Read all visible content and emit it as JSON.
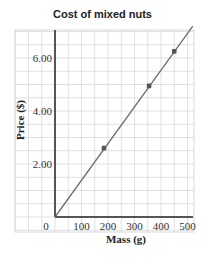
{
  "chart_data": {
    "type": "line",
    "title": "Cost of mixed nuts",
    "xlabel": "Mass (g)",
    "ylabel": "Price ($)",
    "xlim": [
      0,
      520
    ],
    "ylim": [
      0,
      7.2
    ],
    "x_ticks": [
      "0",
      "100",
      "200",
      "300",
      "400",
      "500"
    ],
    "y_ticks": [
      "2.00",
      "4.00",
      "6.00"
    ],
    "grid": true,
    "series": [
      {
        "name": "Price vs Mass",
        "line": {
          "x": [
            0,
            520
          ],
          "y": [
            0,
            7.2
          ]
        },
        "points": [
          {
            "x": 185,
            "y": 2.6
          },
          {
            "x": 355,
            "y": 4.95
          },
          {
            "x": 450,
            "y": 6.25
          }
        ]
      }
    ]
  },
  "colors": {
    "grid": "#d9d9d9",
    "axis": "#222222",
    "line": "#6e6e6e",
    "point": "#555555"
  }
}
